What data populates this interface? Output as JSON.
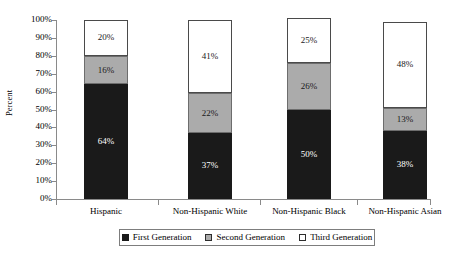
{
  "chart_data": {
    "type": "bar",
    "subtype": "stacked-100-percent",
    "title": "",
    "xlabel": "",
    "ylabel": "Percent",
    "ylim": [
      0,
      100
    ],
    "y_tick_labels": [
      "100%",
      "90%",
      "80%",
      "70%",
      "60%",
      "50%",
      "40%",
      "30%",
      "20%",
      "10%",
      "0%"
    ],
    "y_tick_values": [
      100,
      90,
      80,
      70,
      60,
      50,
      40,
      30,
      20,
      10,
      0
    ],
    "grid": false,
    "legend_position": "bottom",
    "categories": [
      "Hispanic",
      "Non-Hispanic White",
      "Non-Hispanic Black",
      "Non-Hispanic Asian"
    ],
    "series": [
      {
        "name": "First Generation",
        "color": "#1a1a1a",
        "values": [
          64,
          37,
          50,
          38
        ],
        "labels": [
          "64%",
          "37%",
          "50%",
          "38%"
        ]
      },
      {
        "name": "Second Generation",
        "color": "#ababab",
        "values": [
          16,
          22,
          26,
          13
        ],
        "labels": [
          "16%",
          "22%",
          "26%",
          "13%"
        ]
      },
      {
        "name": "Third Generation",
        "color": "#ffffff",
        "values": [
          20,
          41,
          25,
          48
        ],
        "labels": [
          "20%",
          "41%",
          "25%",
          "48%"
        ]
      }
    ]
  },
  "legend": {
    "entries": [
      {
        "label": "First Generation",
        "swatch": "first"
      },
      {
        "label": "Second Generation",
        "swatch": "second"
      },
      {
        "label": "Third Generation",
        "swatch": "third"
      }
    ]
  },
  "colors": {
    "first_generation": "#1a1a1a",
    "second_generation": "#ababab",
    "third_generation": "#ffffff",
    "axis": "#8a8a8a",
    "text": "#000000",
    "background": "#ffffff"
  }
}
